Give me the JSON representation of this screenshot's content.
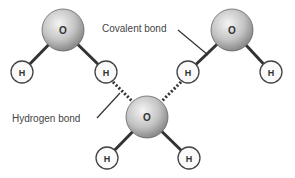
{
  "diagram": {
    "labels": {
      "covalent": "Covalent bond",
      "hydrogen": "Hydrogen bond"
    },
    "atoms": {
      "oxygen": "O",
      "hydrogen": "H"
    },
    "molecules": [
      {
        "name": "water-molecule-top-left",
        "o": [
          63,
          30
        ],
        "h": [
          [
            22,
            72
          ],
          [
            106,
            72
          ]
        ]
      },
      {
        "name": "water-molecule-top-right",
        "o": [
          232,
          30
        ],
        "h": [
          [
            188,
            72
          ],
          [
            271,
            72
          ]
        ]
      },
      {
        "name": "water-molecule-bottom",
        "o": [
          147,
          117
        ],
        "h": [
          [
            107,
            158
          ],
          [
            189,
            158
          ]
        ]
      }
    ]
  }
}
